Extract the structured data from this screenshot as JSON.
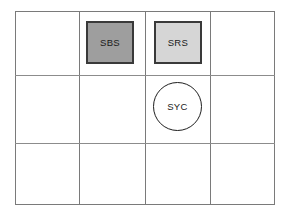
{
  "diagram": {
    "type": "grid-placement-diagram",
    "grid": {
      "columns": 4,
      "rows": 3,
      "line_color": "#7a7a7a",
      "background": "#ffffff"
    },
    "nodes": [
      {
        "id": "sbs",
        "label": "SBS",
        "shape": "square",
        "fill": "#9e9e9e",
        "stroke": "#3a3a3a",
        "cell_column": 2,
        "cell_row": 1
      },
      {
        "id": "srs",
        "label": "SRS",
        "shape": "square",
        "fill": "#d6d6d6",
        "stroke": "#3a3a3a",
        "cell_column": 3,
        "cell_row": 1
      },
      {
        "id": "syc",
        "label": "SYC",
        "shape": "circle",
        "fill": "#ffffff",
        "stroke": "#1e1e1e",
        "cell_column": 3,
        "cell_row": 2
      }
    ]
  }
}
